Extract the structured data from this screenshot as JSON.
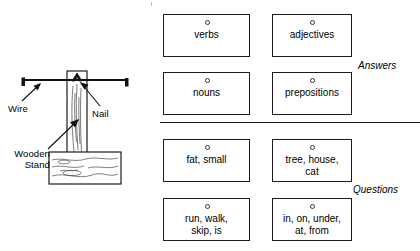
{
  "diagram": {
    "name": "wire-and-nail-apparatus",
    "labels": {
      "wire": "Wire",
      "nail": "Nail",
      "stand": "Wooden\nStand"
    }
  },
  "panel": {
    "sections": {
      "answers_label": "Answers",
      "questions_label": "Questions"
    },
    "answer_cards": [
      {
        "id": "verbs",
        "text": "verbs"
      },
      {
        "id": "adjectives",
        "text": "adjectives"
      },
      {
        "id": "nouns",
        "text": "nouns"
      },
      {
        "id": "prepositions",
        "text": "prepositions"
      }
    ],
    "question_cards": [
      {
        "id": "adjective-examples",
        "text": "fat, small"
      },
      {
        "id": "noun-examples",
        "text": "tree, house,\ncat"
      },
      {
        "id": "verb-examples",
        "text": "run, walk,\nskip, is"
      },
      {
        "id": "preposition-examples",
        "text": "in, on, under,\nat, from"
      }
    ]
  }
}
